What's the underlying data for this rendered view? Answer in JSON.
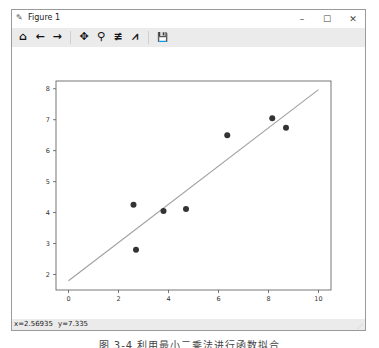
{
  "window": {
    "title": "Figure 1",
    "controls": {
      "minimize": "–",
      "maximize": "☐",
      "close": "✕"
    }
  },
  "toolbar": {
    "items": [
      {
        "name": "home-icon",
        "glyph": "⌂",
        "label": "Home"
      },
      {
        "name": "back-icon",
        "glyph": "←",
        "label": "Back"
      },
      {
        "name": "forward-icon",
        "glyph": "→",
        "label": "Forward"
      },
      {
        "name": "pan-icon",
        "glyph": "✥",
        "label": "Pan"
      },
      {
        "name": "zoom-icon",
        "glyph": "⚲",
        "label": "Zoom"
      },
      {
        "name": "subplots-icon",
        "glyph": "≢",
        "label": "Configure subplots"
      },
      {
        "name": "edit-axes-icon",
        "glyph": "⩘",
        "label": "Edit axis"
      },
      {
        "name": "save-icon",
        "glyph": "💾",
        "label": "Save"
      }
    ]
  },
  "status": {
    "x": "x=2.56935",
    "y": "y=7.335"
  },
  "caption": "图 3-4  利用最小二乘法进行函数拟合",
  "colors": {
    "points": "#333333",
    "line": "#a0a0a0",
    "axes": "#555555"
  },
  "chart_data": {
    "type": "scatter",
    "title": "",
    "xlabel": "",
    "ylabel": "",
    "xlim": [
      -0.5,
      10.5
    ],
    "ylim": [
      1.5,
      8.25
    ],
    "xticks": [
      0,
      2,
      4,
      6,
      8,
      10
    ],
    "yticks": [
      2,
      3,
      4,
      5,
      6,
      7,
      8
    ],
    "grid": false,
    "series": [
      {
        "name": "data",
        "kind": "scatter",
        "x": [
          2.6,
          2.7,
          3.8,
          4.7,
          6.35,
          8.15,
          8.7
        ],
        "y": [
          4.25,
          2.8,
          4.05,
          4.12,
          6.5,
          7.05,
          6.74
        ]
      },
      {
        "name": "fit",
        "kind": "line",
        "x": [
          0,
          10
        ],
        "y": [
          1.8,
          7.97
        ]
      }
    ]
  }
}
